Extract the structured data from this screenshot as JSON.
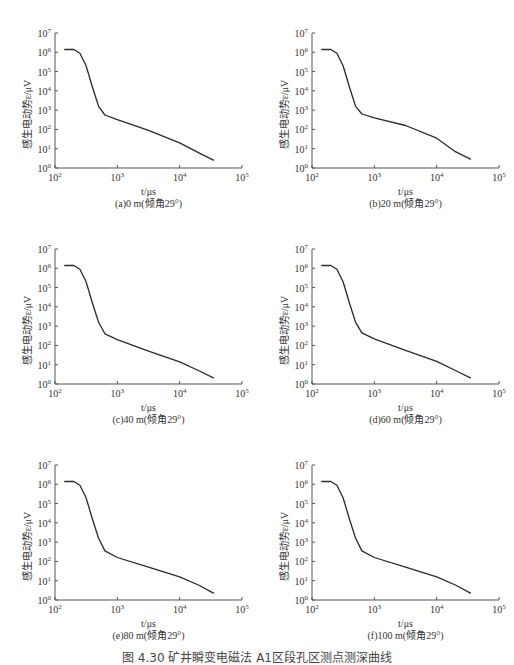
{
  "figure_caption": "图 4.30  矿井瞬变电磁法 A1区段孔区测点测深曲线",
  "shared_axes": {
    "xlabel": "t/μs",
    "ylabel": "感生电动势ε/μV",
    "x_ticks": [
      "10^2",
      "10^3",
      "10^4",
      "10^5"
    ],
    "y_ticks": [
      "10^0",
      "10^1",
      "10^2",
      "10^3",
      "10^4",
      "10^5",
      "10^6",
      "10^7"
    ]
  },
  "chart_data": [
    {
      "type": "line",
      "title": "(a)0 m(倾角29°)",
      "xlabel": "t/μs",
      "ylabel": "感生电动势ε/μV",
      "xscale": "log",
      "yscale": "log",
      "xlim": [
        100,
        100000
      ],
      "ylim": [
        1,
        10000000
      ],
      "grid": false,
      "series": [
        {
          "name": "0 m",
          "x": [
            141,
            200,
            251,
            316,
            398,
            501,
            631,
            1000,
            3162,
            10000,
            19953,
            35481
          ],
          "y": [
            1400000,
            1400000,
            890000,
            200000,
            15800,
            1580,
            560,
            320,
            89,
            20,
            6.3,
            2.5
          ]
        }
      ]
    },
    {
      "type": "line",
      "title": "(b)20 m(倾角29°)",
      "xlabel": "t/μs",
      "ylabel": "感生电动势ε/μV",
      "xscale": "log",
      "yscale": "log",
      "xlim": [
        100,
        100000
      ],
      "ylim": [
        1,
        10000000
      ],
      "grid": false,
      "series": [
        {
          "name": "20 m",
          "x": [
            141,
            200,
            251,
            316,
            398,
            501,
            631,
            1000,
            3162,
            10000,
            19953,
            35481
          ],
          "y": [
            1400000,
            1400000,
            890000,
            200000,
            15800,
            1580,
            630,
            400,
            160,
            35,
            7,
            2.8
          ]
        }
      ]
    },
    {
      "type": "line",
      "title": "(c)40 m(倾角29°)",
      "xlabel": "t/μs",
      "ylabel": "感生电动势ε/μV",
      "xscale": "log",
      "yscale": "log",
      "xlim": [
        100,
        100000
      ],
      "ylim": [
        1,
        10000000
      ],
      "grid": false,
      "series": [
        {
          "name": "40 m",
          "x": [
            141,
            200,
            251,
            316,
            398,
            501,
            631,
            1000,
            3162,
            10000,
            19953,
            35481
          ],
          "y": [
            1400000,
            1400000,
            890000,
            200000,
            15800,
            1580,
            400,
            200,
            50,
            14,
            5,
            2
          ]
        }
      ]
    },
    {
      "type": "line",
      "title": "(d)60 m(倾角29°)",
      "xlabel": "t/μs",
      "ylabel": "感生电动势ε/μV",
      "xscale": "log",
      "yscale": "log",
      "xlim": [
        100,
        100000
      ],
      "ylim": [
        1,
        10000000
      ],
      "grid": false,
      "series": [
        {
          "name": "60 m",
          "x": [
            141,
            200,
            251,
            316,
            398,
            501,
            631,
            1000,
            3162,
            10000,
            19953,
            35481
          ],
          "y": [
            1400000,
            1400000,
            890000,
            200000,
            15800,
            1580,
            450,
            220,
            55,
            15,
            5,
            2
          ]
        }
      ]
    },
    {
      "type": "line",
      "title": "(e)80 m(倾角29°)",
      "xlabel": "t/μs",
      "ylabel": "感生电动势ε/μV",
      "xscale": "log",
      "yscale": "log",
      "xlim": [
        100,
        100000
      ],
      "ylim": [
        1,
        10000000
      ],
      "grid": false,
      "series": [
        {
          "name": "80 m",
          "x": [
            141,
            200,
            251,
            316,
            398,
            501,
            631,
            1000,
            3162,
            10000,
            19953,
            35481
          ],
          "y": [
            1400000,
            1400000,
            890000,
            200000,
            15800,
            1580,
            350,
            160,
            50,
            16,
            6,
            2.2
          ]
        }
      ]
    },
    {
      "type": "line",
      "title": "(f)100 m(倾角29°)",
      "xlabel": "t/μs",
      "ylabel": "感生电动势ε/μV",
      "xscale": "log",
      "yscale": "log",
      "xlim": [
        100,
        100000
      ],
      "ylim": [
        1,
        10000000
      ],
      "grid": false,
      "series": [
        {
          "name": "100 m",
          "x": [
            141,
            200,
            251,
            316,
            398,
            501,
            631,
            1000,
            3162,
            10000,
            19953,
            35481
          ],
          "y": [
            1400000,
            1400000,
            890000,
            200000,
            15800,
            1580,
            350,
            160,
            50,
            16,
            6,
            2.2
          ]
        }
      ]
    }
  ],
  "panels": [
    {
      "left": 0,
      "top": 0
    },
    {
      "left": 257,
      "top": 0
    },
    {
      "left": 0,
      "top": 216
    },
    {
      "left": 257,
      "top": 216
    },
    {
      "left": 0,
      "top": 432
    },
    {
      "left": 257,
      "top": 432
    }
  ],
  "colors": {
    "line": "#2a2a2a",
    "axis": "#555555",
    "text": "#333333"
  }
}
